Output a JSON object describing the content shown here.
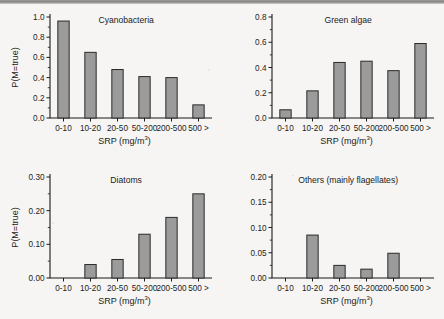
{
  "figure": {
    "background_color": "#f6f5f3",
    "bar_fill_color": "#9b9b9b",
    "bar_edge_color": "#2a2a2a",
    "axis_color": "#1b1b1b",
    "shared_xlabel": "SRP (mg/m",
    "shared_xlabel_superscript": "3",
    "shared_xlabel_close": ")",
    "shared_ylabel": "P(M=true)",
    "categories": [
      "0-10",
      "10-20",
      "20-50",
      "50-200",
      "200-500",
      "500 >"
    ]
  },
  "chart_data": [
    {
      "type": "bar",
      "title": "Cyanobacteria",
      "xlabel": "SRP (mg/m3)",
      "ylabel": "P(M=true)",
      "categories": [
        "0-10",
        "10-20",
        "20-50",
        "50-200",
        "200-500",
        "500 >"
      ],
      "values": [
        0.96,
        0.65,
        0.48,
        0.41,
        0.4,
        0.13
      ],
      "ylim": [
        0.0,
        1.0
      ],
      "yticks": [
        0.0,
        0.2,
        0.4,
        0.6,
        0.8,
        1.0
      ],
      "ytick_labels": [
        "0.0",
        "0.2",
        "0.4",
        "0.6",
        "0.8",
        "1.0"
      ],
      "grid": false,
      "legend": "none"
    },
    {
      "type": "bar",
      "title": "Green algae",
      "xlabel": "SRP (mg/m3)",
      "ylabel": "",
      "categories": [
        "0-10",
        "10-20",
        "20-50",
        "50-200",
        "200-500",
        "500 >"
      ],
      "values": [
        0.065,
        0.215,
        0.44,
        0.45,
        0.375,
        0.59
      ],
      "ylim": [
        0.0,
        0.8
      ],
      "yticks": [
        0.0,
        0.2,
        0.4,
        0.6,
        0.8
      ],
      "ytick_labels": [
        "0.0",
        "0.2",
        "0.4",
        "0.6",
        "0.8"
      ],
      "grid": false,
      "legend": "none"
    },
    {
      "type": "bar",
      "title": "Diatoms",
      "xlabel": "SRP (mg/m3)",
      "ylabel": "P(M=true)",
      "categories": [
        "0-10",
        "10-20",
        "20-50",
        "50-200",
        "200-500",
        "500 >"
      ],
      "values": [
        0.0,
        0.04,
        0.055,
        0.13,
        0.18,
        0.25
      ],
      "ylim": [
        0.0,
        0.3
      ],
      "yticks": [
        0.0,
        0.1,
        0.2,
        0.3
      ],
      "ytick_labels": [
        "0.00",
        "0.10",
        "0.20",
        "0.30"
      ],
      "minor_yticks": [
        0.05,
        0.15,
        0.25
      ],
      "grid": false,
      "legend": "none"
    },
    {
      "type": "bar",
      "title": "Others (mainly flagellates)",
      "xlabel": "SRP (mg/m3)",
      "ylabel": "",
      "categories": [
        "0-10",
        "10-20",
        "20-50",
        "50-200",
        "200-500",
        "500 >"
      ],
      "values": [
        0.0,
        0.085,
        0.025,
        0.0175,
        0.049,
        0.0
      ],
      "ylim": [
        0.0,
        0.2
      ],
      "yticks": [
        0.0,
        0.05,
        0.1,
        0.15,
        0.2
      ],
      "ytick_labels": [
        "0.00",
        "0.05",
        "0.10",
        "0.15",
        "0.20"
      ],
      "grid": false,
      "legend": "none"
    }
  ]
}
